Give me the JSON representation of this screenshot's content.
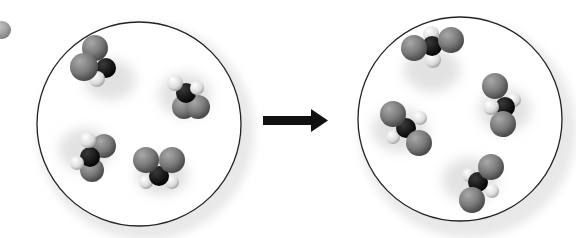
{
  "diagram": {
    "type": "reaction-particle-diagram",
    "colors": {
      "background": "#ffffff",
      "circle_outline": "#222222",
      "large_atom": "#7a7a7a",
      "central_atom": "#111111",
      "small_atom": "#e0e0e0",
      "arrow": "#111111"
    },
    "left_container": {
      "label": "reactants",
      "molecule_count": 4
    },
    "arrow": {
      "direction": "right",
      "meaning": "reaction-arrow"
    },
    "right_container": {
      "label": "products",
      "molecule_count": 4
    },
    "partial_sphere": {
      "location": "top-left-edge"
    }
  }
}
